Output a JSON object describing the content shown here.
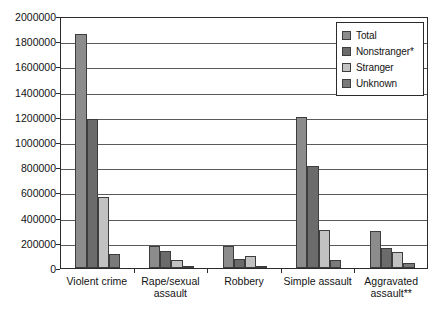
{
  "chart_data": {
    "type": "bar",
    "title": "",
    "xlabel": "",
    "ylabel": "",
    "ylim": [
      0,
      2000000
    ],
    "ytick_step": 200000,
    "grid": true,
    "legend_position": "top-right",
    "categories": [
      "Violent crime",
      "Rape/sexual assault",
      "Robbery",
      "Simple assault",
      "Aggravated assault**"
    ],
    "category_lines": [
      [
        "Violent crime"
      ],
      [
        "Rape/sexual",
        "assault"
      ],
      [
        "Robbery"
      ],
      [
        "Simple assault"
      ],
      [
        "Aggravated",
        "assault**"
      ]
    ],
    "ytick_labels": [
      "0",
      "200000",
      "400000",
      "600000",
      "800000",
      "1000000",
      "1200000",
      "1400000",
      "1600000",
      "1800000",
      "2000000"
    ],
    "series": [
      {
        "name": "Total",
        "color": "#8c8c8c",
        "values": [
          1860000,
          172000,
          175000,
          1195000,
          290000
        ]
      },
      {
        "name": "Nonstranger*",
        "color": "#6b6b6b",
        "values": [
          1185000,
          135000,
          75000,
          810000,
          160000
        ]
      },
      {
        "name": "Stranger",
        "color": "#c2c2c2",
        "values": [
          560000,
          63000,
          95000,
          300000,
          130000
        ]
      },
      {
        "name": "Unknown",
        "color": "#7a7a7a",
        "values": [
          110000,
          10000,
          8000,
          65000,
          40000
        ]
      }
    ]
  },
  "legend": {
    "items": [
      {
        "label": "Total",
        "color": "#8c8c8c"
      },
      {
        "label": "Nonstranger*",
        "color": "#6b6b6b"
      },
      {
        "label": "Stranger",
        "color": "#c2c2c2"
      },
      {
        "label": "Unknown",
        "color": "#7a7a7a"
      }
    ]
  }
}
